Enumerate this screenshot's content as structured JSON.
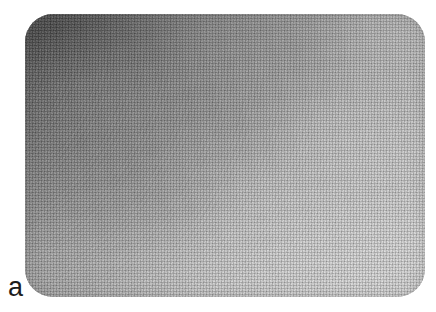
{
  "figure": {
    "label": "a",
    "panel": {
      "alt_text": "Grayscale halftone micrograph with a smooth diagonal brightness gradient, dark at the upper-left and bright toward the lower-right",
      "corner_radius_px": 28,
      "left_px": 25,
      "top_px": 14,
      "width_px": 400,
      "height_px": 283
    },
    "colors": {
      "page_background": "#ffffff",
      "label_text": "#1c1c1c",
      "darkest_region": "#6f6f6f",
      "mid_region": "#a0a0a0",
      "lightest_region": "#cbcbcb"
    },
    "tone_samples": [
      {
        "region": "top-left",
        "value": "#787878"
      },
      {
        "region": "top-center",
        "value": "#8e8e8e"
      },
      {
        "region": "top-right",
        "value": "#9a9a9a"
      },
      {
        "region": "left-middle",
        "value": "#a0a0a0"
      },
      {
        "region": "center",
        "value": "#b0b0b0"
      },
      {
        "region": "right-middle",
        "value": "#bcbcbc"
      },
      {
        "region": "bottom-left",
        "value": "#b4b4b4"
      },
      {
        "region": "bottom-center",
        "value": "#c3c3c3"
      },
      {
        "region": "bottom-right",
        "value": "#c8c8c8"
      }
    ]
  }
}
